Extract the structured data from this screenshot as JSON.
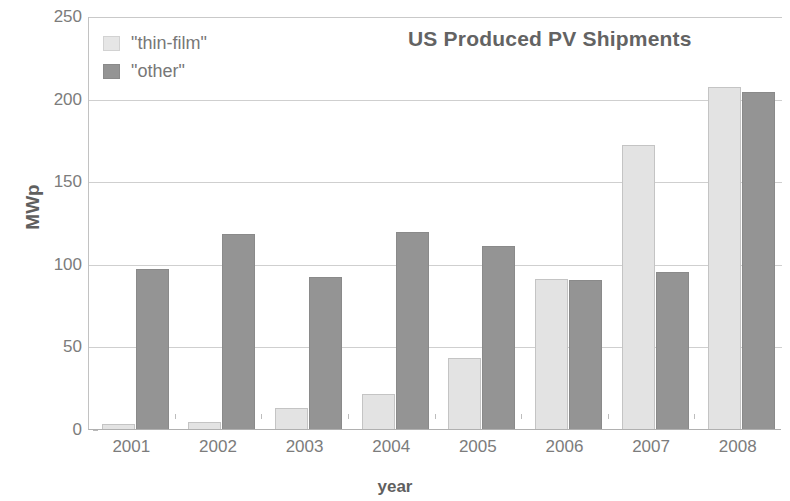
{
  "chart_data": {
    "type": "bar",
    "title": "US Produced PV Shipments",
    "xlabel": "year",
    "ylabel": "MWp",
    "categories": [
      "2001",
      "2002",
      "2003",
      "2004",
      "2005",
      "2006",
      "2007",
      "2008"
    ],
    "series": [
      {
        "name": "\"thin-film\"",
        "color": "#e3e3e3",
        "values": [
          3,
          4,
          13,
          21,
          43,
          91,
          172,
          207
        ]
      },
      {
        "name": "\"other\"",
        "color": "#949494",
        "values": [
          97,
          118,
          92,
          119,
          111,
          90,
          95,
          204
        ]
      }
    ],
    "ylim": [
      0,
      250
    ],
    "yticks": [
      0,
      50,
      100,
      150,
      200,
      250
    ],
    "ytick_labels": [
      "0",
      "50",
      "100",
      "150",
      "200",
      "250"
    ],
    "grid": true,
    "legend_position": "top-left"
  },
  "legend": {
    "items": [
      {
        "label": "\"thin-film\"",
        "swatch": "thin"
      },
      {
        "label": "\"other\"",
        "swatch": "other"
      }
    ]
  }
}
